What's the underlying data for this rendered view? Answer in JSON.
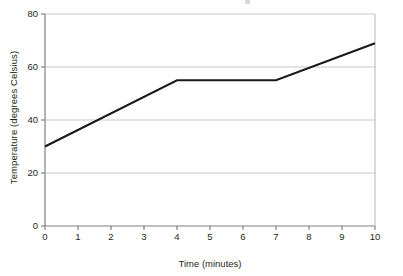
{
  "chart_data": {
    "type": "line",
    "title": "",
    "xlabel": "Time (minutes)",
    "ylabel": "Temperature (degrees Celsius)",
    "x": [
      0,
      1,
      2,
      3,
      4,
      5,
      6,
      7,
      8,
      9,
      10
    ],
    "series": [
      {
        "name": "Temperature",
        "values": [
          30,
          36.2,
          42.5,
          48.8,
          55,
          55,
          55,
          55,
          59.7,
          64.3,
          69
        ],
        "color": "#1a1a1a"
      }
    ],
    "vertices": [
      {
        "x": 0,
        "y": 30
      },
      {
        "x": 4,
        "y": 55
      },
      {
        "x": 7,
        "y": 55
      },
      {
        "x": 10,
        "y": 69
      }
    ],
    "xlim": [
      0,
      10
    ],
    "ylim": [
      0,
      80
    ],
    "xticks": [
      0,
      1,
      2,
      3,
      4,
      5,
      6,
      7,
      8,
      9,
      10
    ],
    "yticks": [
      0,
      20,
      40,
      60,
      80
    ],
    "xtick_labels": [
      "0",
      "1",
      "2",
      "3",
      "4",
      "5",
      "6",
      "7",
      "8",
      "9",
      "10"
    ],
    "ytick_labels": [
      "0",
      "20",
      "40",
      "60",
      "80"
    ],
    "grid": "horizontal",
    "grid_color": "#c8c8c8",
    "axis_color": "#808080",
    "legend": "none",
    "background": "#ffffff"
  }
}
